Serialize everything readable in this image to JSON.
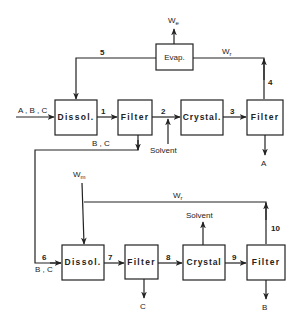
{
  "diagram": {
    "type": "process-flow",
    "units": {
      "top_dissolver": "Dissol.",
      "top_filter1": "Filter",
      "top_crystallizer": "Crystal.",
      "top_filter2": "Filter",
      "evaporator": "Evap.",
      "bottom_dissolver": "Dissol.",
      "bottom_filter1": "Filter",
      "bottom_crystallizer": "Crystal",
      "bottom_filter2": "Filter"
    },
    "stream_numbers": {
      "s1": "1",
      "s2": "2",
      "s3": "3",
      "s4": "4",
      "s5": "5",
      "s6": "6",
      "s7": "7",
      "s8": "8",
      "s9": "9",
      "s10": "10"
    },
    "labels": {
      "feed": "A , B , C",
      "bc_top": "B , C",
      "bc_bottom": "B , C",
      "solvent_in": "Solvent",
      "solvent_out": "Solvent",
      "product_a": "A",
      "product_b": "B",
      "product_c": "C",
      "we_main": "W",
      "we_sub": "e",
      "wr_top_main": "W",
      "wr_top_sub": "r",
      "wm_main": "W",
      "wm_sub": "m",
      "wr_bottom_main": "W",
      "wr_bottom_sub": "r"
    },
    "colors": {
      "stroke": "#222222",
      "background": "#ffffff"
    }
  }
}
